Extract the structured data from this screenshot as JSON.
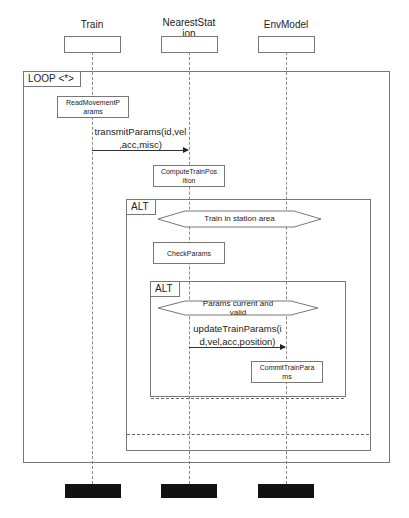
{
  "diagram": {
    "lifelines": [
      {
        "name": "Train",
        "x": 92
      },
      {
        "name": "NearestStat\nion",
        "line1": "NearestStat",
        "line2": "ion",
        "x": 189
      },
      {
        "name": "EnvModel",
        "x": 286
      }
    ],
    "loop_frame": {
      "label": "LOOP <*>"
    },
    "activities": {
      "read_movement": {
        "line1": "ReadMovementP",
        "line2": "arams"
      },
      "compute_position": {
        "line1": "ComputeTrainPos",
        "line2": "ition"
      },
      "check_params": {
        "label": "CheckParams"
      },
      "commit_params": {
        "line1": "CommitTrainPara",
        "line2": "ms"
      }
    },
    "messages": {
      "transmit": {
        "line1": "transmitParams(id,vel",
        "line2": ",acc,misc)"
      },
      "update": {
        "line1": "updateTrainParams(i",
        "line2": "d,vel,acc,position)"
      }
    },
    "outer_alt": {
      "label": "ALT",
      "guard": "Train in station area"
    },
    "inner_alt": {
      "label": "ALT",
      "guard_line1": "Params current and",
      "guard_line2": "valid"
    }
  }
}
